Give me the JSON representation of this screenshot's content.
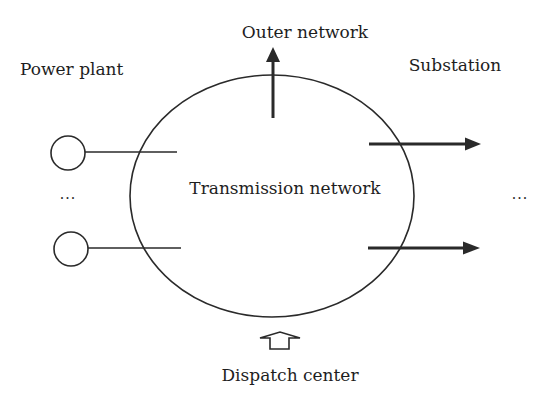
{
  "diagram": {
    "center_node": {
      "label": "Transmission network"
    },
    "outer_network": {
      "label": "Outer network",
      "direction": "outflow"
    },
    "power_plant": {
      "label": "Power plant",
      "count_shown": 2,
      "ellipsis": "..."
    },
    "substation": {
      "label": "Substation",
      "count_shown": 2,
      "ellipsis": "..."
    },
    "dispatch_center": {
      "label": "Dispatch center",
      "direction": "control-input"
    },
    "colors": {
      "line": "#2a2a2a",
      "text": "#1e1e1e",
      "background": "#ffffff"
    }
  }
}
